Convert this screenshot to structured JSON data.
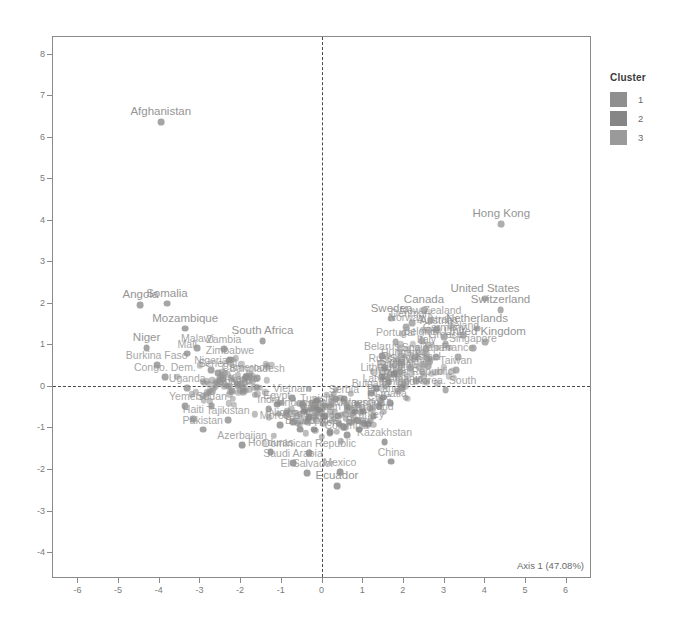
{
  "chart_data": {
    "type": "scatter",
    "title": "",
    "xlabel": "Axis 1 (47.08%)",
    "ylabel": "Axis 2 (16.92%)",
    "xlim": [
      -6.6,
      6.6
    ],
    "ylim": [
      -4.6,
      8.4
    ],
    "xticks": [
      -6,
      -5,
      -4,
      -3,
      -2,
      -1,
      0,
      1,
      2,
      3,
      4,
      5,
      6
    ],
    "yticks": [
      -4,
      -3,
      -2,
      -1,
      0,
      1,
      2,
      3,
      4,
      5,
      6,
      7,
      8
    ],
    "grid": false,
    "reference_lines": {
      "vertical_x": 0,
      "horizontal_y": 0,
      "style": "dashed"
    },
    "legend": {
      "title": "Cluster",
      "position": "right",
      "entries": [
        {
          "label": "1",
          "color": "#8f8f8f"
        },
        {
          "label": "2",
          "color": "#868686"
        },
        {
          "label": "3",
          "color": "#9a9a9a"
        }
      ]
    },
    "labeled_points": [
      {
        "label": "Afghanistan",
        "x": -3.95,
        "y": 6.35,
        "cluster": 1
      },
      {
        "label": "Hong Kong",
        "x": 4.42,
        "y": 3.9,
        "cluster": 3
      },
      {
        "label": "Angola",
        "x": -4.45,
        "y": 1.95,
        "cluster": 1
      },
      {
        "label": "Somalia",
        "x": -3.8,
        "y": 1.98,
        "cluster": 1
      },
      {
        "label": "Mozambique",
        "x": -3.35,
        "y": 1.38,
        "cluster": 1
      },
      {
        "label": "Niger",
        "x": -4.3,
        "y": 0.92,
        "cluster": 1
      },
      {
        "label": "Malawi",
        "x": -3.05,
        "y": 0.92,
        "cluster": 1
      },
      {
        "label": "Mali",
        "x": -3.3,
        "y": 0.78,
        "cluster": 1
      },
      {
        "label": "Zambia",
        "x": -2.4,
        "y": 0.88,
        "cluster": 1
      },
      {
        "label": "Zimbabwe",
        "x": -2.25,
        "y": 0.62,
        "cluster": 1
      },
      {
        "label": "South Africa",
        "x": -1.45,
        "y": 1.08,
        "cluster": 1
      },
      {
        "label": "Burkina Faso",
        "x": -4.05,
        "y": 0.5,
        "cluster": 1
      },
      {
        "label": "Congo. Dem.",
        "x": -3.85,
        "y": 0.22,
        "cluster": 1
      },
      {
        "label": "Uganda",
        "x": -3.3,
        "y": -0.05,
        "cluster": 1
      },
      {
        "label": "Yemen",
        "x": -3.35,
        "y": -0.48,
        "cluster": 1
      },
      {
        "label": "Sudan",
        "x": -2.7,
        "y": -0.48,
        "cluster": 1
      },
      {
        "label": "Haiti",
        "x": -3.15,
        "y": -0.8,
        "cluster": 1
      },
      {
        "label": "Tajikistan",
        "x": -2.3,
        "y": -0.82,
        "cluster": 1
      },
      {
        "label": "Pakistan",
        "x": -2.92,
        "y": -1.05,
        "cluster": 1
      },
      {
        "label": "Azerbaijan",
        "x": -1.95,
        "y": -1.42,
        "cluster": 2
      },
      {
        "label": "Honduras",
        "x": -1.25,
        "y": -1.6,
        "cluster": 2
      },
      {
        "label": "Dominican Republic",
        "x": -0.3,
        "y": -1.62,
        "cluster": 2
      },
      {
        "label": "Saudi Arabia",
        "x": -0.7,
        "y": -1.85,
        "cluster": 2
      },
      {
        "label": "El Salvador",
        "x": -0.35,
        "y": -2.1,
        "cluster": 2
      },
      {
        "label": "Mexico",
        "x": 0.45,
        "y": -2.08,
        "cluster": 2
      },
      {
        "label": "Ecuador",
        "x": 0.38,
        "y": -2.42,
        "cluster": 2
      },
      {
        "label": "China",
        "x": 1.72,
        "y": -1.82,
        "cluster": 2
      },
      {
        "label": "Kazakhstan",
        "x": 1.55,
        "y": -1.35,
        "cluster": 2
      },
      {
        "label": "Sweden",
        "x": 1.72,
        "y": 1.62,
        "cluster": 3
      },
      {
        "label": "Canada",
        "x": 2.52,
        "y": 1.82,
        "cluster": 3
      },
      {
        "label": "Australia",
        "x": 2.85,
        "y": 1.38,
        "cluster": 3
      },
      {
        "label": "Austria",
        "x": 2.82,
        "y": 1.35,
        "cluster": 3
      },
      {
        "label": "Netherlands",
        "x": 3.82,
        "y": 1.38,
        "cluster": 3
      },
      {
        "label": "United States",
        "x": 4.02,
        "y": 2.1,
        "cluster": 3
      },
      {
        "label": "Switzerland",
        "x": 4.4,
        "y": 1.82,
        "cluster": 3
      },
      {
        "label": "United Kingdom",
        "x": 4.02,
        "y": 1.05,
        "cluster": 3
      },
      {
        "label": "Portugal",
        "x": 1.82,
        "y": 1.05,
        "cluster": 3
      },
      {
        "label": "Belgium",
        "x": 2.48,
        "y": 1.08,
        "cluster": 3
      },
      {
        "label": "Greece",
        "x": 3.05,
        "y": 1.0,
        "cluster": 3
      },
      {
        "label": "Belarus",
        "x": 1.48,
        "y": 0.72,
        "cluster": 2
      },
      {
        "label": "Spain",
        "x": 2.3,
        "y": 0.7,
        "cluster": 3
      },
      {
        "label": "Japan",
        "x": 2.82,
        "y": 0.7,
        "cluster": 3
      },
      {
        "label": "France",
        "x": 3.35,
        "y": 0.7,
        "cluster": 3
      },
      {
        "label": "Hungary",
        "x": 1.95,
        "y": 0.58,
        "cluster": 3
      },
      {
        "label": "Russia",
        "x": 1.55,
        "y": 0.42,
        "cluster": 2
      },
      {
        "label": "Taiwan",
        "x": 3.3,
        "y": 0.38,
        "cluster": 3
      },
      {
        "label": "Ukraine",
        "x": 1.65,
        "y": 0.1,
        "cluster": 2
      },
      {
        "label": "Czech Republic",
        "x": 2.32,
        "y": 0.12,
        "cluster": 3
      },
      {
        "label": "Romania",
        "x": 1.98,
        "y": -0.05,
        "cluster": 2
      },
      {
        "label": "Finland",
        "x": 1.88,
        "y": -0.12,
        "cluster": 3
      },
      {
        "label": "Korea. South",
        "x": 3.05,
        "y": -0.1,
        "cluster": 3
      },
      {
        "label": "Ghana",
        "x": -2.2,
        "y": -0.12,
        "cluster": 1
      },
      {
        "label": "Kenya",
        "x": -1.92,
        "y": -0.05,
        "cluster": 1
      },
      {
        "label": "Bangladesh",
        "x": -1.58,
        "y": 0.18,
        "cluster": 1
      },
      {
        "label": "Cameroon",
        "x": -1.85,
        "y": 0.22,
        "cluster": 1
      },
      {
        "label": "Senegal",
        "x": -2.55,
        "y": 0.3,
        "cluster": 1
      },
      {
        "label": "Nigeria",
        "x": -2.72,
        "y": 0.38,
        "cluster": 1
      },
      {
        "label": "India",
        "x": -1.3,
        "y": -0.55,
        "cluster": 1
      },
      {
        "label": "Egypt",
        "x": -1.1,
        "y": -0.45,
        "cluster": 2
      },
      {
        "label": "Morocco",
        "x": -1.02,
        "y": -0.95,
        "cluster": 2
      },
      {
        "label": "Nicaragua",
        "x": -0.7,
        "y": -0.88,
        "cluster": 2
      },
      {
        "label": "Bolivia",
        "x": -0.52,
        "y": -1.05,
        "cluster": 2
      },
      {
        "label": "Philippines",
        "x": -0.18,
        "y": -1.05,
        "cluster": 2
      },
      {
        "label": "Peru",
        "x": 0.22,
        "y": -1.12,
        "cluster": 2
      },
      {
        "label": "Colombia",
        "x": 0.62,
        "y": -1.18,
        "cluster": 2
      },
      {
        "label": "Brazil",
        "x": 0.92,
        "y": -1.05,
        "cluster": 2
      },
      {
        "label": "Turkey",
        "x": 1.15,
        "y": -0.92,
        "cluster": 2
      },
      {
        "label": "Thailand",
        "x": 1.28,
        "y": -0.72,
        "cluster": 2
      },
      {
        "label": "Argentina",
        "x": 1.02,
        "y": -0.62,
        "cluster": 2
      },
      {
        "label": "Chile",
        "x": 1.42,
        "y": -0.48,
        "cluster": 2
      },
      {
        "label": "Poland",
        "x": 1.52,
        "y": -0.28,
        "cluster": 2
      },
      {
        "label": "Bulgaria",
        "x": 1.22,
        "y": -0.18,
        "cluster": 2
      },
      {
        "label": "Malaysia",
        "x": 0.82,
        "y": -0.62,
        "cluster": 2
      },
      {
        "label": "Indonesia",
        "x": -0.42,
        "y": -0.62,
        "cluster": 2
      },
      {
        "label": "Vietnam",
        "x": -0.72,
        "y": -0.3,
        "cluster": 2
      },
      {
        "label": "Iran",
        "x": -0.3,
        "y": -0.75,
        "cluster": 2
      },
      {
        "label": "Tunisia",
        "x": -0.12,
        "y": -0.52,
        "cluster": 2
      },
      {
        "label": "Jordan",
        "x": 0.08,
        "y": -0.72,
        "cluster": 2
      },
      {
        "label": "Serbia",
        "x": 0.55,
        "y": -0.32,
        "cluster": 2
      },
      {
        "label": "Croatia",
        "x": 1.68,
        "y": -0.42,
        "cluster": 2
      },
      {
        "label": "Latvia",
        "x": 1.35,
        "y": -0.05,
        "cluster": 2
      },
      {
        "label": "Lithuania",
        "x": 1.48,
        "y": 0.22,
        "cluster": 2
      },
      {
        "label": "Estonia",
        "x": 1.78,
        "y": 0.28,
        "cluster": 2
      },
      {
        "label": "Slovakia",
        "x": 1.92,
        "y": 0.35,
        "cluster": 3
      },
      {
        "label": "Slovenia",
        "x": 2.18,
        "y": 0.42,
        "cluster": 3
      },
      {
        "label": "Israel",
        "x": 2.62,
        "y": 0.48,
        "cluster": 3
      },
      {
        "label": "Italy",
        "x": 2.58,
        "y": 0.88,
        "cluster": 3
      },
      {
        "label": "Germany",
        "x": 3.02,
        "y": 1.18,
        "cluster": 3
      },
      {
        "label": "Denmark",
        "x": 2.22,
        "y": 1.52,
        "cluster": 3
      },
      {
        "label": "Norway",
        "x": 2.08,
        "y": 1.42,
        "cluster": 3
      },
      {
        "label": "Ireland",
        "x": 3.48,
        "y": 1.22,
        "cluster": 3
      },
      {
        "label": "New Zealand",
        "x": 2.68,
        "y": 1.58,
        "cluster": 3
      },
      {
        "label": "Singapore",
        "x": 3.72,
        "y": 0.92,
        "cluster": 3
      }
    ],
    "unlabeled_cloud_seed": 20240101,
    "unlabeled_cloud_count": 260,
    "point_color_default": "#9a9a9a"
  },
  "style": {
    "background": "#ffffff",
    "frame_color": "#8a8a8a",
    "tick_color": "#7a7a7a",
    "label_color": "#909090",
    "refline_color": "#4a4a4a"
  }
}
